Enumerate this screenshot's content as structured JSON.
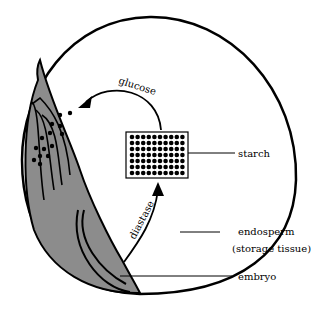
{
  "diagram": {
    "type": "seed cross-section",
    "colors": {
      "outline": "#000000",
      "embryo_fill": "#8c8c8c",
      "background": "#ffffff"
    },
    "labels": {
      "starch": "starch",
      "endosperm": "endosperm",
      "storage_tissue": "(storage tissue)",
      "embryo": "embryo",
      "glucose": "glucose",
      "diastase": "diastase"
    },
    "starch_grid": {
      "rows": 7,
      "cols": 10
    }
  }
}
